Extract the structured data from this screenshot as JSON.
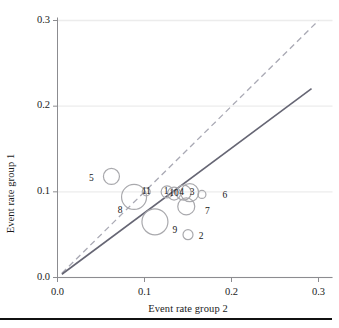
{
  "figure": {
    "bottom_rule": true,
    "axis_color": "#8c8c90",
    "grid_color": "#ececec",
    "bubble_color": "#a9a9ad",
    "identity_line_color": "#a9a9b4",
    "regression_line_color": "#666674"
  },
  "chart_data": {
    "type": "scatter",
    "title": "",
    "xlabel": "Event rate group 2",
    "ylabel": "Event rate group 1",
    "xlim": [
      0.0,
      0.3
    ],
    "ylim": [
      0.0,
      0.3
    ],
    "xticks": [
      "0.0",
      "0.1",
      "0.2",
      "0.3"
    ],
    "yticks": [
      "0.0",
      "0.1",
      "0.2",
      "0.3"
    ],
    "xtick_values": [
      0.0,
      0.1,
      0.2,
      0.3
    ],
    "ytick_values": [
      0.0,
      0.1,
      0.2,
      0.3
    ],
    "grid": "horizontal",
    "legend": "none",
    "bubble_encoding": "marker size proportional to study weight",
    "points": [
      {
        "label": "1",
        "x": 0.126,
        "y": 0.1,
        "r": 6.0,
        "label_dx": -1.0,
        "label_dy": 0.0,
        "label_pos": "inside"
      },
      {
        "label": "2",
        "x": 0.15,
        "y": 0.05,
        "r": 5.0,
        "label_dx": 13.0,
        "label_dy": 2.0,
        "label_pos": "right"
      },
      {
        "label": "3",
        "x": 0.152,
        "y": 0.099,
        "r": 9.0,
        "label_dx": 2.5,
        "label_dy": 0.0,
        "label_pos": "inside"
      },
      {
        "label": "4",
        "x": 0.145,
        "y": 0.099,
        "r": 7.5,
        "label_dx": -2.0,
        "label_dy": 0.0,
        "label_pos": "inside"
      },
      {
        "label": "5",
        "x": 0.062,
        "y": 0.118,
        "r": 8.0,
        "label_dx": -20.0,
        "label_dy": 3.0,
        "label_pos": "left"
      },
      {
        "label": "6",
        "x": 0.166,
        "y": 0.097,
        "r": 4.0,
        "label_dx": 23.0,
        "label_dy": 2.0,
        "label_pos": "right"
      },
      {
        "label": "7",
        "x": 0.148,
        "y": 0.083,
        "r": 8.5,
        "label_dx": 21.0,
        "label_dy": 6.0,
        "label_pos": "right"
      },
      {
        "label": "8",
        "x": 0.088,
        "y": 0.094,
        "r": 12.5,
        "label_dx": -14.0,
        "label_dy": 14.0,
        "label_pos": "below-left"
      },
      {
        "label": "9",
        "x": 0.112,
        "y": 0.065,
        "r": 13.0,
        "label_dx": 20.0,
        "label_dy": 9.0,
        "label_pos": "right"
      },
      {
        "label": "10",
        "x": 0.134,
        "y": 0.098,
        "r": 6.5,
        "label_dx": 0.0,
        "label_dy": 0.0,
        "label_pos": "inside"
      },
      {
        "label": "11",
        "x": 0.102,
        "y": 0.1,
        "r": 4.0,
        "label_dx": 0.0,
        "label_dy": 0.0,
        "label_pos": "inside"
      }
    ],
    "lines": [
      {
        "name": "identity",
        "style": "dashed",
        "slope": 1.0,
        "intercept": 0.0,
        "x_from": 0.005,
        "x_to": 0.3
      },
      {
        "name": "regression",
        "style": "solid",
        "slope": 0.755,
        "intercept": 0.0,
        "x_from": 0.005,
        "x_to": 0.292
      }
    ]
  }
}
